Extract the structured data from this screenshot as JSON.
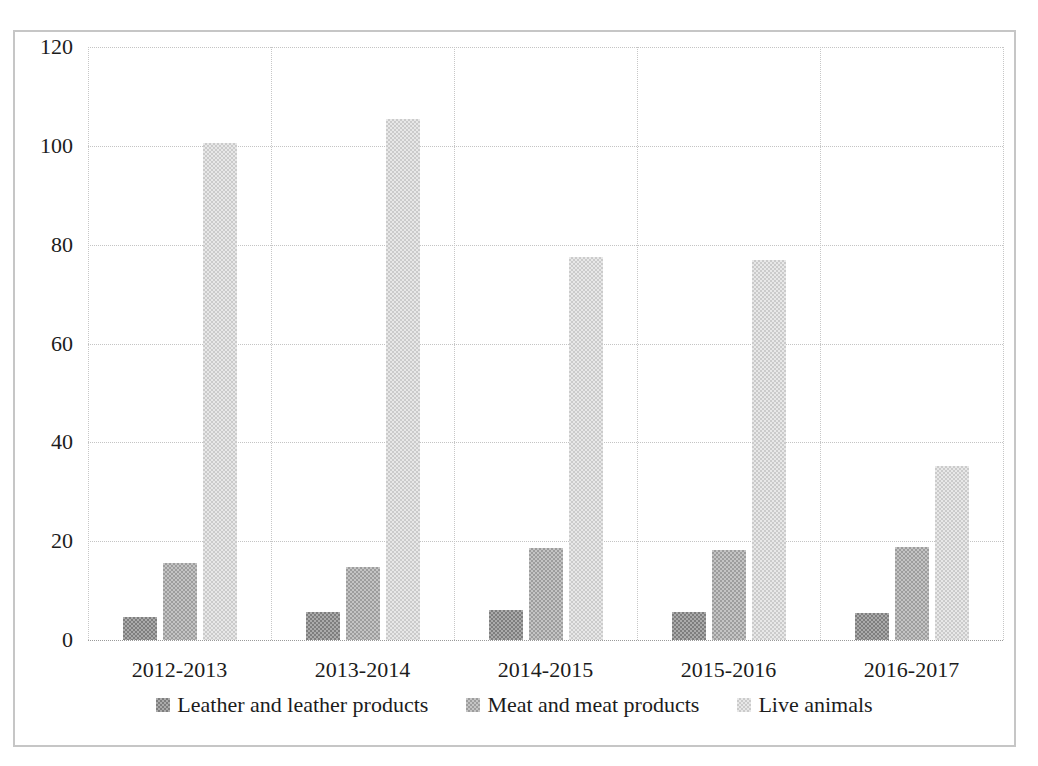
{
  "figure": {
    "border_color": "#c6c6c6",
    "background_color": "#ffffff",
    "gridline_color": "#c4c4c4",
    "text_color": "#1c1c1c"
  },
  "chart_data": {
    "type": "bar",
    "title": "",
    "xlabel": "",
    "ylabel": "",
    "categories": [
      "2012-2013",
      "2013-2014",
      "2014-2015",
      "2015-2016",
      "2016-2017"
    ],
    "series": [
      {
        "name": "Leather and leather products",
        "color": "#8f8f8f",
        "checker": [
          "#7e7e7e",
          "#ababab"
        ],
        "values": [
          4.7,
          5.7,
          6.0,
          5.7,
          5.5
        ]
      },
      {
        "name": "Meat and meat products",
        "color": "#ababab",
        "checker": [
          "#9d9d9d",
          "#c4c4c4"
        ],
        "values": [
          15.5,
          14.7,
          18.6,
          18.3,
          18.9
        ]
      },
      {
        "name": "Live animals",
        "color": "#d7d7d7",
        "checker": [
          "#cbcbcb",
          "#e8e8e8"
        ],
        "values": [
          100.5,
          105.5,
          77.5,
          77.0,
          35.3
        ]
      }
    ],
    "ylim": [
      0,
      120
    ],
    "yticks": [
      0,
      20,
      40,
      60,
      80,
      100,
      120
    ],
    "grid": true,
    "legend_position": "bottom"
  }
}
